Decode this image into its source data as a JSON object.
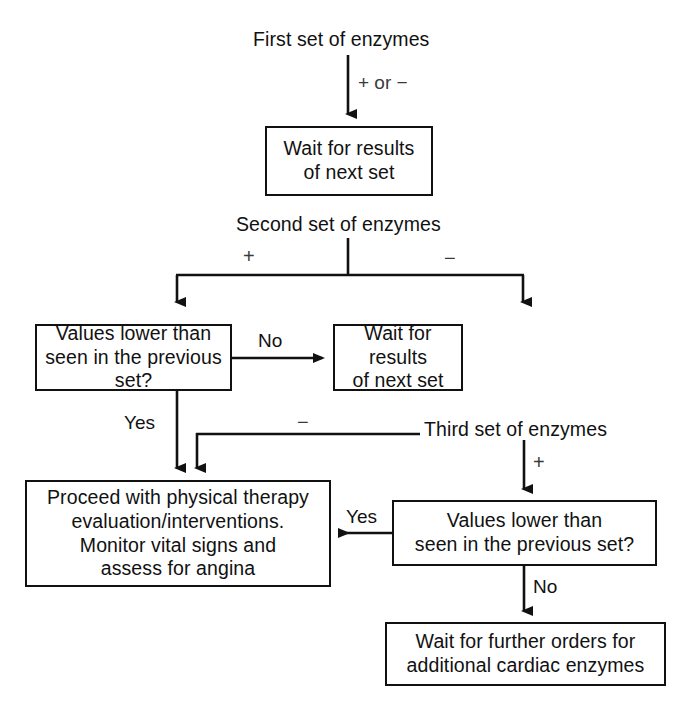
{
  "diagram": {
    "line_color": "#111111",
    "background_color": "#ffffff",
    "nodes": [
      {
        "id": "first-set",
        "type": "label",
        "text": "First set of enzymes"
      },
      {
        "id": "wait-next-set-1",
        "type": "process",
        "text": "Wait for results\nof next set"
      },
      {
        "id": "second-set",
        "type": "label",
        "text": "Second set of enzymes"
      },
      {
        "id": "values-lower-1",
        "type": "decision",
        "text": "Values lower than\nseen in the previous set?"
      },
      {
        "id": "wait-next-set-2",
        "type": "process",
        "text": "Wait for results\nof next set"
      },
      {
        "id": "third-set",
        "type": "label",
        "text": "Third set of enzymes"
      },
      {
        "id": "proceed-pt",
        "type": "process",
        "text": "Proceed with physical therapy\nevaluation/interventions.\nMonitor vital signs and\nassess for angina"
      },
      {
        "id": "values-lower-2",
        "type": "decision",
        "text": "Values lower than\nseen in the previous set?"
      },
      {
        "id": "wait-further-orders",
        "type": "process",
        "text": "Wait for further orders for\nadditional cardiac enzymes"
      }
    ],
    "edge_labels": [
      {
        "id": "edge-plus-or-minus",
        "text": "+ or −",
        "from": "first-set",
        "to": "wait-next-set-1"
      },
      {
        "id": "edge-second-plus",
        "text": "+",
        "from": "second-set",
        "to": "values-lower-1"
      },
      {
        "id": "edge-second-minus",
        "text": "−",
        "from": "second-set",
        "to": "wait-next-set-2"
      },
      {
        "id": "edge-no-1",
        "text": "No",
        "from": "values-lower-1",
        "to": "wait-next-set-2"
      },
      {
        "id": "edge-yes-1",
        "text": "Yes",
        "from": "values-lower-1",
        "to": "proceed-pt"
      },
      {
        "id": "edge-third-minus",
        "text": "−",
        "from": "third-set",
        "to": "proceed-pt"
      },
      {
        "id": "edge-third-plus",
        "text": "+",
        "from": "third-set",
        "to": "values-lower-2"
      },
      {
        "id": "edge-yes-2",
        "text": "Yes",
        "from": "values-lower-2",
        "to": "proceed-pt"
      },
      {
        "id": "edge-no-2",
        "text": "No",
        "from": "values-lower-2",
        "to": "wait-further-orders"
      }
    ]
  }
}
